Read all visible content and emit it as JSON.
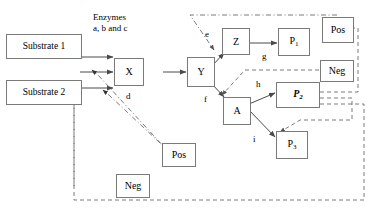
{
  "diagram": {
    "title_note": "Enzymes\na, b and c",
    "substrates": [
      {
        "label": "Substrate 1"
      },
      {
        "label": "Substrate 2"
      }
    ],
    "metabolites": [
      {
        "id": "X",
        "label": "X"
      },
      {
        "id": "Y",
        "label": "Y"
      },
      {
        "id": "Z",
        "label": "Z"
      },
      {
        "id": "A",
        "label": "A"
      }
    ],
    "products": [
      {
        "id": "P1",
        "base": "P",
        "sub": "1",
        "style": "regular"
      },
      {
        "id": "P2",
        "base": "P",
        "sub": "2",
        "style": "bold-italic"
      },
      {
        "id": "P3",
        "base": "P",
        "sub": "3",
        "style": "regular"
      }
    ],
    "regulators": [
      {
        "id": "pos-top",
        "label": "Pos",
        "sign": "positive"
      },
      {
        "id": "neg-right",
        "label": "Neg",
        "sign": "negative"
      },
      {
        "id": "pos-bottom",
        "label": "Pos",
        "sign": "positive"
      },
      {
        "id": "neg-bottom",
        "label": "Neg",
        "sign": "negative"
      }
    ],
    "reaction_labels": [
      {
        "id": "d",
        "label": "d"
      },
      {
        "id": "e",
        "label": "e"
      },
      {
        "id": "f",
        "label": "f"
      },
      {
        "id": "g",
        "label": "g"
      },
      {
        "id": "h",
        "label": "h"
      },
      {
        "id": "i",
        "label": "i"
      }
    ],
    "colors": {
      "box_border": "#7a7a7a",
      "arrow": "#4a4a4a",
      "regulatory": "#6b6b6b",
      "text": "#000000",
      "background": "#ffffff"
    }
  }
}
